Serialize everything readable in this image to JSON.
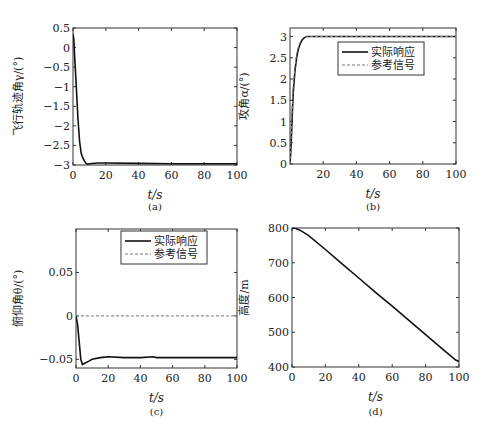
{
  "chart_data": [
    {
      "id": "a",
      "type": "line",
      "panel_label": "(a)",
      "title": "",
      "xlabel": "t/s",
      "ylabel": "飞行轨迹角γ/(°)",
      "xlim": [
        0,
        100
      ],
      "ylim": [
        -3,
        0.5
      ],
      "xticks": [
        0,
        20,
        40,
        60,
        80,
        100
      ],
      "yticks": [
        0.5,
        0,
        -0.5,
        -1,
        -1.5,
        -2,
        -2.5,
        -3
      ],
      "ytick_labels": [
        "0.5",
        "0",
        "−0.5",
        "−1",
        "−1.5",
        "−2",
        "−2.5",
        "−3"
      ],
      "grid": false,
      "series": [
        {
          "name": "飞行轨迹角",
          "style": "solid",
          "x": [
            0,
            0.5,
            1,
            2,
            3,
            4,
            5,
            6,
            7,
            8,
            9,
            10,
            15,
            20,
            40,
            60,
            80,
            100
          ],
          "y": [
            0.35,
            0.2,
            -0.2,
            -1.0,
            -1.8,
            -2.4,
            -2.7,
            -2.82,
            -2.9,
            -2.96,
            -2.98,
            -2.97,
            -2.95,
            -2.95,
            -2.96,
            -2.97,
            -2.97,
            -2.97
          ]
        }
      ]
    },
    {
      "id": "b",
      "type": "line",
      "panel_label": "(b)",
      "title": "",
      "xlabel": "t/s",
      "ylabel": "攻角α/(°)",
      "xlim": [
        0,
        100
      ],
      "ylim": [
        0,
        3.2
      ],
      "xticks": [
        20,
        40,
        60,
        80,
        100
      ],
      "yticks": [
        0,
        0.5,
        1,
        1.5,
        2,
        2.5,
        3
      ],
      "ytick_labels": [
        "0",
        "0.5",
        "1",
        "1.5",
        "2",
        "2.5",
        "3"
      ],
      "grid": false,
      "legend": {
        "position": "upper right",
        "entries": [
          "实际响应",
          "参考信号"
        ]
      },
      "series": [
        {
          "name": "实际响应",
          "style": "solid",
          "x": [
            0,
            0.5,
            1,
            1.5,
            2,
            3,
            4,
            5,
            6,
            7,
            8,
            9,
            10,
            20,
            40,
            60,
            80,
            100
          ],
          "y": [
            0,
            0.3,
            0.8,
            1.3,
            1.7,
            2.2,
            2.5,
            2.7,
            2.82,
            2.9,
            2.95,
            2.98,
            3.0,
            3.0,
            3.0,
            3.0,
            3.0,
            3.0
          ]
        },
        {
          "name": "参考信号",
          "style": "dashed",
          "x": [
            0,
            0.5,
            1,
            1.5,
            2,
            3,
            4,
            5,
            6,
            7,
            8,
            9,
            10,
            20,
            40,
            60,
            80,
            100
          ],
          "y": [
            0,
            0.45,
            1.0,
            1.45,
            1.85,
            2.3,
            2.58,
            2.75,
            2.86,
            2.93,
            2.97,
            2.99,
            3.0,
            3.0,
            3.0,
            3.0,
            3.0,
            3.0
          ]
        }
      ]
    },
    {
      "id": "c",
      "type": "line",
      "panel_label": "(c)",
      "title": "",
      "xlabel": "t/s",
      "ylabel": "俯仰角θ/(°)",
      "xlim": [
        0,
        100
      ],
      "ylim": [
        -0.06,
        0.1
      ],
      "xticks": [
        0,
        20,
        40,
        60,
        80,
        100
      ],
      "yticks": [
        0.05,
        0,
        -0.05
      ],
      "ytick_labels": [
        "0.05",
        "0",
        "−0.05"
      ],
      "grid": false,
      "legend": {
        "position": "upper right",
        "entries": [
          "实际响应",
          "参考信号"
        ]
      },
      "series": [
        {
          "name": "实际响应",
          "style": "solid",
          "x": [
            0,
            1,
            2,
            3,
            4,
            6,
            8,
            10,
            15,
            20,
            30,
            40,
            48,
            50,
            55,
            60,
            80,
            100
          ],
          "y": [
            0,
            -0.01,
            -0.03,
            -0.05,
            -0.056,
            -0.054,
            -0.052,
            -0.05,
            -0.048,
            -0.047,
            -0.048,
            -0.048,
            -0.047,
            -0.048,
            -0.048,
            -0.048,
            -0.048,
            -0.048
          ]
        },
        {
          "name": "参考信号",
          "style": "dashed",
          "x": [
            0,
            100
          ],
          "y": [
            0,
            0
          ]
        }
      ]
    },
    {
      "id": "d",
      "type": "line",
      "panel_label": "(d)",
      "title": "",
      "xlabel": "t/s",
      "ylabel": "高度/m",
      "xlim": [
        0,
        100
      ],
      "ylim": [
        400,
        800
      ],
      "xticks": [
        0,
        20,
        40,
        60,
        80,
        100
      ],
      "yticks": [
        400,
        500,
        600,
        700,
        800
      ],
      "ytick_labels": [
        "400",
        "500",
        "600",
        "700",
        "800"
      ],
      "grid": false,
      "series": [
        {
          "name": "高度",
          "style": "solid",
          "x": [
            0,
            2,
            5,
            10,
            20,
            30,
            40,
            50,
            60,
            70,
            80,
            90,
            98,
            100
          ],
          "y": [
            800,
            799,
            793,
            778,
            738,
            697,
            656,
            615,
            575,
            534,
            493,
            452,
            420,
            416
          ]
        }
      ]
    }
  ]
}
